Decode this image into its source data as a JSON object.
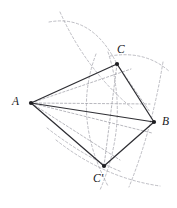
{
  "figure": {
    "stroke_solid_color": "#2e2e33",
    "stroke_dashed_color": "#9a9aa2",
    "background_color": "#ffffff"
  },
  "points": {
    "A": {
      "label": "A",
      "x": 31,
      "y": 103,
      "label_x": 12,
      "label_y": 96
    },
    "B": {
      "label": "B",
      "x": 154,
      "y": 122,
      "label_x": 162,
      "label_y": 116
    },
    "C": {
      "label": "C",
      "x": 117,
      "y": 64,
      "label_x": 117,
      "label_y": 44
    },
    "Cprime": {
      "label": "C′",
      "x": 104,
      "y": 166,
      "label_x": 93,
      "label_y": 173
    }
  },
  "edges": {
    "solid": [
      {
        "name": "segment-AC",
        "from": "A",
        "to": "C"
      },
      {
        "name": "segment-AB",
        "from": "A",
        "to": "B"
      },
      {
        "name": "segment-CB",
        "from": "C",
        "to": "B"
      },
      {
        "name": "segment-ACprime",
        "from": "A",
        "to": "Cprime"
      },
      {
        "name": "segment-CprimeB",
        "from": "Cprime",
        "to": "B"
      }
    ],
    "dashed_construction": [
      {
        "name": "construction-A-upper",
        "x1": 31,
        "y1": 103,
        "x2": 131,
        "y2": 69
      },
      {
        "name": "construction-A-mid-upper",
        "x1": 31,
        "y1": 103,
        "x2": 150,
        "y2": 104
      },
      {
        "name": "construction-A-mid-lower",
        "x1": 31,
        "y1": 103,
        "x2": 152,
        "y2": 133
      },
      {
        "name": "construction-A-lower",
        "x1": 31,
        "y1": 103,
        "x2": 120,
        "y2": 160
      },
      {
        "name": "construction-C-down",
        "x1": 117,
        "y1": 64,
        "x2": 104,
        "y2": 166
      },
      {
        "name": "construction-C-to-B-inner",
        "x1": 117,
        "y1": 64,
        "x2": 150,
        "y2": 112
      }
    ]
  },
  "arcs": {
    "items": [
      {
        "name": "arc-upper-left-to-C",
        "d": "M 49 22 Q 92 14 117 64"
      },
      {
        "name": "arc-through-C-right",
        "d": "M 110 56 Q 146 50 170 72"
      },
      {
        "name": "arc-center-vertical-left",
        "d": "M 96 54 Q 72 118 108 186"
      },
      {
        "name": "arc-center-vertical-right",
        "d": "M 108 52 Q 130 120 100 190"
      },
      {
        "name": "arc-right-long",
        "d": "M 163 62 Q 152 130 129 187"
      },
      {
        "name": "arc-lower-sweep",
        "d": "M 56 140 Q 104 178 160 186"
      },
      {
        "name": "arc-upper-diagonal",
        "d": "M 60 12 Q 86 70 132 108"
      },
      {
        "name": "arc-lower-left-small",
        "d": "M 47 128 Q 86 158 122 172"
      }
    ]
  }
}
